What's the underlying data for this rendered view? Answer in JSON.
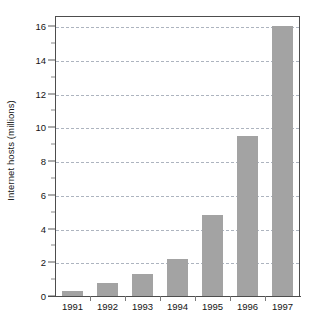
{
  "chart_data": {
    "type": "bar",
    "title": "",
    "xlabel": "",
    "ylabel": "Internet hosts (millions)",
    "categories": [
      "1991",
      "1992",
      "1993",
      "1994",
      "1995",
      "1996",
      "1997"
    ],
    "values": [
      0.3,
      0.75,
      1.3,
      2.2,
      4.8,
      9.5,
      16.0
    ],
    "ylim": [
      0,
      16.6
    ],
    "ytick_major": [
      0,
      2,
      4,
      6,
      8,
      10,
      12,
      14,
      16
    ],
    "ytick_minor": [
      1,
      3,
      5,
      7,
      9,
      11,
      13,
      15
    ],
    "ytick_labels": [
      "0",
      "2",
      "4",
      "6",
      "8",
      "10",
      "12",
      "14",
      "16"
    ],
    "grid": true,
    "grid_axis": "y",
    "grid_style": "dashed",
    "legend": "none",
    "bar_color": "#a3a3a3",
    "grid_color": "#9fa8b5",
    "axis_color": "#4d4d4d",
    "background": "#ffffff"
  }
}
